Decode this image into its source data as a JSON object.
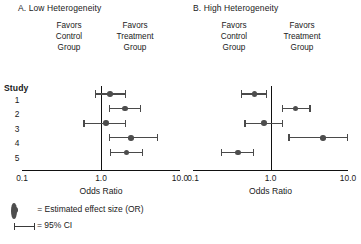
{
  "figure": {
    "legend": {
      "point_symbol_text": "= Estimated effect size (OR)",
      "ci_symbol_text": "= 95% CI",
      "point_icon": "filled-circle-icon",
      "ci_icon": "error-bar-icon"
    },
    "study_header": "Study",
    "marker_color": "#4d4d4d",
    "line_color": "#4a4a4a",
    "axis_color": "#111111"
  },
  "chart_data": [
    {
      "type": "scatter",
      "subtype": "forest-plot",
      "panel_id": "A",
      "title": "A. Low Heterogeneity",
      "xlabel": "Odds Ratio",
      "ylabel": "Study",
      "xscale": "log",
      "xlim": [
        0.1,
        10.0
      ],
      "xticks": [
        0.1,
        1.0,
        10.0
      ],
      "xticklabels": [
        "0.1",
        "1.0",
        "10.0"
      ],
      "grid": false,
      "reference_line": 1.0,
      "left_annotation": [
        "Favors",
        "Control",
        "Group"
      ],
      "right_annotation": [
        "Favors",
        "Treatment",
        "Group"
      ],
      "categories": [
        "1",
        "2",
        "3",
        "4",
        "5"
      ],
      "points": [
        {
          "study": "1",
          "or": 1.3,
          "ci_low": 0.84,
          "ci_high": 2.1
        },
        {
          "study": "2",
          "or": 2.0,
          "ci_low": 1.25,
          "ci_high": 3.2
        },
        {
          "study": "3",
          "or": 1.15,
          "ci_low": 0.6,
          "ci_high": 2.1
        },
        {
          "study": "4",
          "or": 2.4,
          "ci_low": 1.25,
          "ci_high": 5.3
        },
        {
          "study": "5",
          "or": 2.1,
          "ci_low": 1.3,
          "ci_high": 3.4
        }
      ]
    },
    {
      "type": "scatter",
      "subtype": "forest-plot",
      "panel_id": "B",
      "title": "B. High Heterogeneity",
      "xlabel": "Odds Ratio",
      "ylabel": "Study",
      "xscale": "log",
      "xlim": [
        0.1,
        10.0
      ],
      "xticks": [
        0.1,
        1.0,
        10.0
      ],
      "xticklabels": [
        "0.1",
        "1.0",
        "10.0"
      ],
      "grid": false,
      "reference_line": 1.0,
      "left_annotation": [
        "Favors",
        "Control",
        "Group"
      ],
      "right_annotation": [
        "Favors",
        "Treatment",
        "Group"
      ],
      "categories": [
        "1",
        "2",
        "3",
        "4",
        "5"
      ],
      "points": [
        {
          "study": "1",
          "or": 0.62,
          "ci_low": 0.42,
          "ci_high": 0.9
        },
        {
          "study": "2",
          "or": 2.1,
          "ci_low": 1.4,
          "ci_high": 3.3
        },
        {
          "study": "3",
          "or": 0.82,
          "ci_low": 0.46,
          "ci_high": 1.45
        },
        {
          "study": "4",
          "or": 4.8,
          "ci_low": 1.7,
          "ci_high": 10.0
        },
        {
          "study": "5",
          "or": 0.38,
          "ci_low": 0.23,
          "ci_high": 0.62
        }
      ]
    }
  ]
}
